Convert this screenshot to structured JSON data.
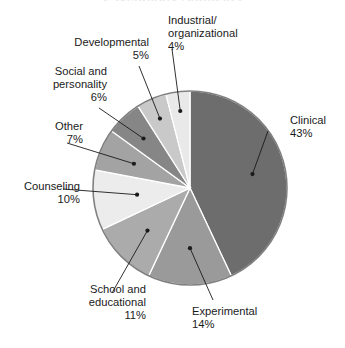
{
  "chart_data": {
    "type": "pie",
    "title": "Psychology Subfields",
    "title_visible": false,
    "xlabel": "",
    "ylabel": "",
    "legend_position": "none",
    "grid": false,
    "labels_show_percent": true,
    "start_angle_deg": 0,
    "direction": "clockwise",
    "categories": [
      "Clinical",
      "Experimental",
      "School and educational",
      "Counseling",
      "Other",
      "Social and personality",
      "Developmental",
      "Industrial/organizational"
    ],
    "values": [
      43,
      14,
      11,
      10,
      7,
      6,
      5,
      4
    ],
    "value_labels": [
      "43%",
      "14%",
      "11%",
      "10%",
      "7%",
      "6%",
      "5%",
      "4%"
    ],
    "colors": [
      "#6d6d6d",
      "#9a9a9a",
      "#ababab",
      "#ececec",
      "#a3a3a3",
      "#868686",
      "#c9c9c9",
      "#e9e9e9"
    ],
    "slice_border_color": "#ffffff",
    "outline_color": "#808080",
    "callout_color": "#1a1a1a",
    "background": "#ffffff"
  },
  "labels": {
    "clinical": {
      "name": "Clinical",
      "pct": "43%"
    },
    "experimental": {
      "name": "Experimental",
      "pct": "14%"
    },
    "school_line1": "School and",
    "school_line2": "educational",
    "school_pct": "11%",
    "counseling": {
      "name": "Counseling",
      "pct": "10%"
    },
    "other": {
      "name": "Other",
      "pct": "7%"
    },
    "social_line1": "Social and",
    "social_line2": "personality",
    "social_pct": "6%",
    "developmental": {
      "name": "Developmental",
      "pct": "5%"
    },
    "indorg_line1": "Industrial/",
    "indorg_line2": "organizational",
    "indorg_pct": "4%"
  }
}
